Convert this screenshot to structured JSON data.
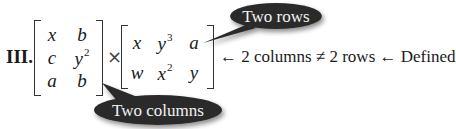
{
  "problem": {
    "label": "III.",
    "operator": "×",
    "left_matrix": {
      "rows": [
        [
          {
            "base": "x",
            "exp": ""
          },
          {
            "base": "b",
            "exp": ""
          }
        ],
        [
          {
            "base": "c",
            "exp": ""
          },
          {
            "base": "y",
            "exp": "2"
          }
        ],
        [
          {
            "base": "a",
            "exp": ""
          },
          {
            "base": "b",
            "exp": ""
          }
        ]
      ]
    },
    "right_matrix": {
      "rows": [
        [
          {
            "base": "x",
            "exp": ""
          },
          {
            "base": "y",
            "exp": "3"
          },
          {
            "base": "a",
            "exp": ""
          }
        ],
        [
          {
            "base": "w",
            "exp": ""
          },
          {
            "base": "x",
            "exp": "2"
          },
          {
            "base": "y",
            "exp": ""
          }
        ]
      ]
    },
    "note": "← 2 columns ≠ 2 rows ← Defined"
  },
  "callouts": {
    "rows": "Two rows",
    "columns": "Two columns"
  },
  "colors": {
    "bubble": "#2b2b2b",
    "bubble_text": "#f2f2f2",
    "text": "#1a1a1a"
  }
}
